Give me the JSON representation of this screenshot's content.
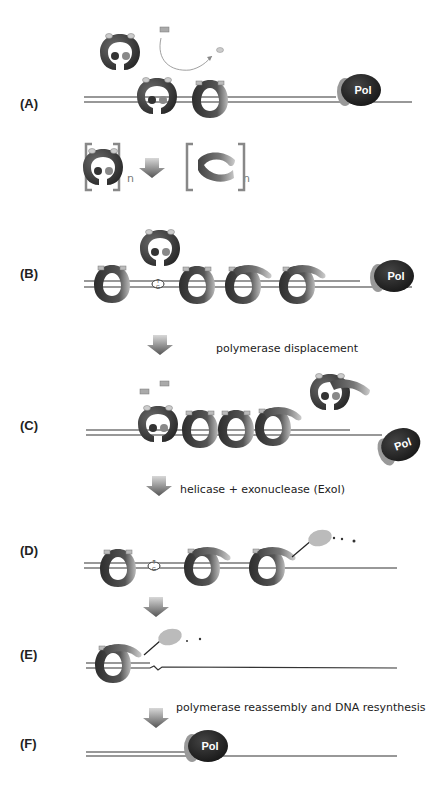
{
  "panels": [
    {
      "id": "A",
      "label": "(A)"
    },
    {
      "id": "B",
      "label": "(B)"
    },
    {
      "id": "C",
      "label": "(C)"
    },
    {
      "id": "D",
      "label": "(D)"
    },
    {
      "id": "E",
      "label": "(E)"
    },
    {
      "id": "F",
      "label": "(F)"
    }
  ],
  "steps": [
    {
      "text": "polymerase displacement"
    },
    {
      "text": "helicase + exonuclease (ExoI)"
    },
    {
      "text": "polymerase reassembly and DNA resynthesis"
    }
  ],
  "oligomer_annotation": {
    "left_subscript": "n",
    "right_subscript": "n"
  },
  "polymerase_label": "Pol",
  "mismatch_bases": {
    "top": "T",
    "bottom": "G"
  },
  "colors": {
    "dna": "#333333",
    "clamp_dark": "#3a3a3a",
    "clamp_light": "#9a9a9a",
    "polymerase": "#2a2a2a",
    "exonuclease": "#b8b8b8",
    "arrow": "#7a7a7a",
    "bracket": "#8a8a8a"
  }
}
